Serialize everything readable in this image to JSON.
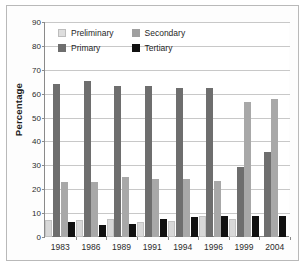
{
  "figure": {
    "y_axis_title": "Percentage"
  },
  "legend": {
    "items": [
      {
        "label": "Preliminary",
        "key": "preliminary",
        "color": "#dedede"
      },
      {
        "label": "Secondary",
        "key": "secondary",
        "color": "#a0a0a0"
      },
      {
        "label": "Primary",
        "key": "primary",
        "color": "#6e6e6e"
      },
      {
        "label": "Tertiary",
        "key": "tertiary",
        "color": "#111111"
      }
    ]
  },
  "chart_data": {
    "type": "bar",
    "title": "",
    "xlabel": "",
    "ylabel": "Percentage",
    "ylim": [
      0,
      90
    ],
    "yticks": [
      0,
      10,
      20,
      30,
      40,
      50,
      60,
      70,
      80,
      90
    ],
    "ytick_labels": [
      "0",
      "10",
      "20",
      "30",
      "40",
      "50",
      "60",
      "70",
      "80",
      "90"
    ],
    "grid": true,
    "legend_position": "top-left-inside",
    "categories": [
      "1983",
      "1986",
      "1989",
      "1991",
      "1994",
      "1996",
      "1999",
      "2004"
    ],
    "series": [
      {
        "name": "Preliminary",
        "color": "#dedede",
        "values": [
          7.1,
          7.1,
          7.4,
          6.4,
          6.5,
          8.6,
          7.5,
          null
        ]
      },
      {
        "name": "Primary",
        "color": "#6e6e6e",
        "values": [
          64.2,
          65.2,
          63.4,
          63.4,
          62.4,
          62.4,
          29.5,
          35.5
        ]
      },
      {
        "name": "Secondary",
        "color": "#a0a0a0",
        "values": [
          22.9,
          23.0,
          25.3,
          24.2,
          24.4,
          23.4,
          56.6,
          57.8
        ]
      },
      {
        "name": "Tertiary",
        "color": "#111111",
        "values": [
          6.1,
          5.2,
          5.3,
          7.4,
          8.5,
          8.6,
          8.7,
          8.8
        ]
      }
    ],
    "series_draw_order": [
      "preliminary",
      "primary",
      "secondary",
      "tertiary"
    ]
  }
}
